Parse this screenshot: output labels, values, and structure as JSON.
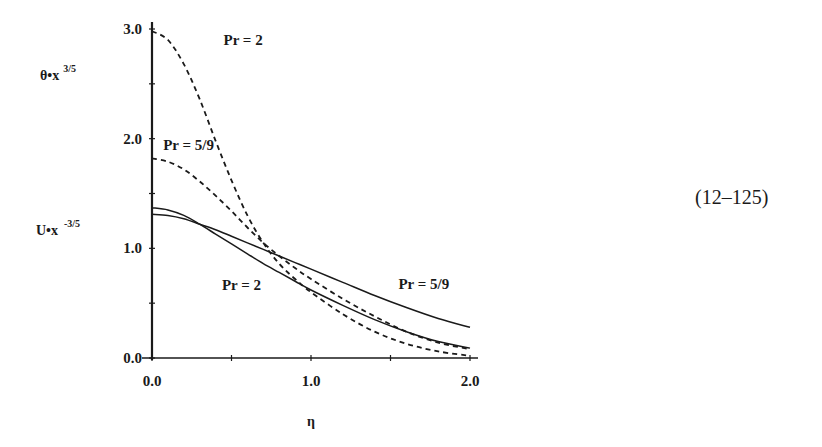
{
  "equation_number": "(12–125)",
  "chart_data": {
    "type": "line",
    "title": "",
    "xlabel": "η",
    "ylabel_top": "θ•x",
    "ylabel_top_exponent": "3/5",
    "ylabel_bottom": "U•x",
    "ylabel_bottom_exponent": "-3/5",
    "xlim": [
      0.0,
      2.0
    ],
    "ylim": [
      0.0,
      3.0
    ],
    "x_ticks": [
      0.0,
      0.5,
      1.0,
      1.5,
      2.0
    ],
    "x_tick_labels": [
      "0.0",
      "1.0",
      "2.0"
    ],
    "y_ticks": [
      0.0,
      0.5,
      1.0,
      1.5,
      2.0,
      2.5,
      3.0
    ],
    "y_tick_labels": [
      "0.0",
      "1.0",
      "2.0",
      "3.0"
    ],
    "grid": false,
    "legend": "inline labels",
    "series": [
      {
        "name": "θ, Pr = 2",
        "style": "dashed",
        "label": "Pr = 2",
        "x": [
          0.0,
          0.1,
          0.2,
          0.3,
          0.4,
          0.5,
          0.6,
          0.7,
          0.8,
          0.9,
          1.0,
          1.2,
          1.4,
          1.6,
          1.8,
          2.0
        ],
        "y": [
          2.98,
          2.9,
          2.68,
          2.36,
          1.98,
          1.62,
          1.3,
          1.05,
          0.86,
          0.72,
          0.6,
          0.4,
          0.24,
          0.13,
          0.06,
          0.02
        ]
      },
      {
        "name": "θ, Pr = 5/9",
        "style": "dashed",
        "label": "Pr = 5/9",
        "x": [
          0.0,
          0.1,
          0.2,
          0.3,
          0.4,
          0.5,
          0.6,
          0.7,
          0.8,
          0.9,
          1.0,
          1.2,
          1.4,
          1.6,
          1.8,
          2.0
        ],
        "y": [
          1.82,
          1.79,
          1.72,
          1.61,
          1.48,
          1.34,
          1.19,
          1.05,
          0.93,
          0.82,
          0.72,
          0.54,
          0.38,
          0.24,
          0.14,
          0.08
        ]
      },
      {
        "name": "U, Pr = 2",
        "style": "solid",
        "label": "Pr = 2",
        "x": [
          0.0,
          0.1,
          0.2,
          0.3,
          0.4,
          0.5,
          0.6,
          0.7,
          0.8,
          0.9,
          1.0,
          1.2,
          1.4,
          1.6,
          1.8,
          2.0
        ],
        "y": [
          1.37,
          1.35,
          1.3,
          1.22,
          1.13,
          1.04,
          0.95,
          0.86,
          0.78,
          0.7,
          0.62,
          0.48,
          0.35,
          0.24,
          0.15,
          0.09
        ]
      },
      {
        "name": "U, Pr = 5/9",
        "style": "solid",
        "label": "Pr = 5/9",
        "x": [
          0.0,
          0.1,
          0.2,
          0.3,
          0.4,
          0.5,
          0.6,
          0.7,
          0.8,
          0.9,
          1.0,
          1.2,
          1.4,
          1.6,
          1.8,
          2.0
        ],
        "y": [
          1.31,
          1.3,
          1.27,
          1.22,
          1.17,
          1.11,
          1.05,
          0.99,
          0.93,
          0.87,
          0.81,
          0.69,
          0.57,
          0.46,
          0.36,
          0.28
        ]
      }
    ],
    "annotations": [
      {
        "text": "Pr = 2",
        "x": 0.45,
        "y": 2.85
      },
      {
        "text": "Pr = 5/9",
        "x": 0.07,
        "y": 1.9
      },
      {
        "text": "Pr = 2",
        "x": 0.44,
        "y": 0.62
      },
      {
        "text": "Pr = 5/9",
        "x": 1.55,
        "y": 0.63
      }
    ]
  }
}
